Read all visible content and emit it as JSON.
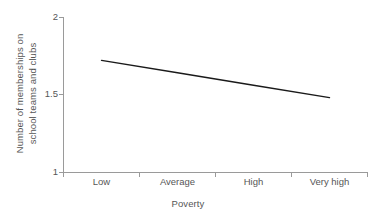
{
  "chart_data": {
    "type": "line",
    "title": "",
    "xlabel": "Poverty",
    "ylabel_line1": "Number of memberships on",
    "ylabel_line2": "school teams and clubs",
    "categories": [
      "Low",
      "Average",
      "High",
      "Very high"
    ],
    "x_tick_labels": [
      "Low",
      "Average",
      "High",
      "Very high"
    ],
    "y_tick_labels": [
      "1",
      "1.5",
      "2"
    ],
    "ylim": [
      1,
      2
    ],
    "yticks": [
      1,
      1.5,
      2
    ],
    "grid": false,
    "legend": "none",
    "series": [
      {
        "name": "Memberships",
        "values": [
          1.72,
          1.64,
          1.56,
          1.48
        ],
        "color": "#1a1a1a"
      }
    ],
    "line_endpoints": {
      "start_value": 1.72,
      "end_value": 1.48
    }
  },
  "axes": {
    "x_title": "Poverty",
    "y_title_line1": "Number of memberships on",
    "y_title_line2": "school teams and clubs",
    "y_tick_0": "1",
    "y_tick_1": "1.5",
    "y_tick_2": "2",
    "x_tick_0": "Low",
    "x_tick_1": "Average",
    "x_tick_2": "High",
    "x_tick_3": "Very high"
  },
  "colors": {
    "axis": "#9a9a9a",
    "line": "#1a1a1a",
    "text": "#565656",
    "background": "#ffffff"
  }
}
